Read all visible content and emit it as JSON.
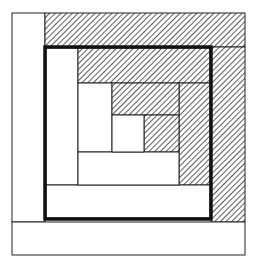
{
  "diagram": {
    "title": "",
    "colors": {
      "background": "#ffffff",
      "line": "#222222",
      "thick_line": "#111111",
      "hatch": "#333333"
    },
    "pieces": [
      {
        "id": "outer-left",
        "fill": "plain",
        "x": 12,
        "y": 13,
        "w": 33,
        "h": 209
      },
      {
        "id": "outer-top",
        "fill": "hatched",
        "x": 45,
        "y": 13,
        "w": 200,
        "h": 34
      },
      {
        "id": "outer-right",
        "fill": "hatched",
        "x": 211,
        "y": 47,
        "w": 34,
        "h": 175
      },
      {
        "id": "outer-bottom",
        "fill": "plain",
        "x": 12,
        "y": 222,
        "w": 233,
        "h": 33
      },
      {
        "id": "ring1-left",
        "fill": "plain",
        "x": 46,
        "y": 48,
        "w": 32,
        "h": 137
      },
      {
        "id": "ring1-top",
        "fill": "hatched",
        "x": 78,
        "y": 48,
        "w": 132,
        "h": 35
      },
      {
        "id": "ring1-right",
        "fill": "hatched",
        "x": 179,
        "y": 83,
        "w": 31,
        "h": 102
      },
      {
        "id": "ring1-bottom",
        "fill": "plain",
        "x": 46,
        "y": 185,
        "w": 164,
        "h": 33
      },
      {
        "id": "ring2-left",
        "fill": "plain",
        "x": 78,
        "y": 83,
        "w": 34,
        "h": 69
      },
      {
        "id": "ring2-top",
        "fill": "hatched",
        "x": 112,
        "y": 83,
        "w": 67,
        "h": 32
      },
      {
        "id": "ring2-right",
        "fill": "hatched",
        "x": 144,
        "y": 115,
        "w": 35,
        "h": 37
      },
      {
        "id": "ring2-bottom",
        "fill": "plain",
        "x": 78,
        "y": 152,
        "w": 101,
        "h": 33
      },
      {
        "id": "center",
        "fill": "plain",
        "x": 112,
        "y": 115,
        "w": 32,
        "h": 37
      }
    ],
    "thick_border": {
      "x": 45,
      "y": 47,
      "w": 166,
      "h": 172
    }
  }
}
